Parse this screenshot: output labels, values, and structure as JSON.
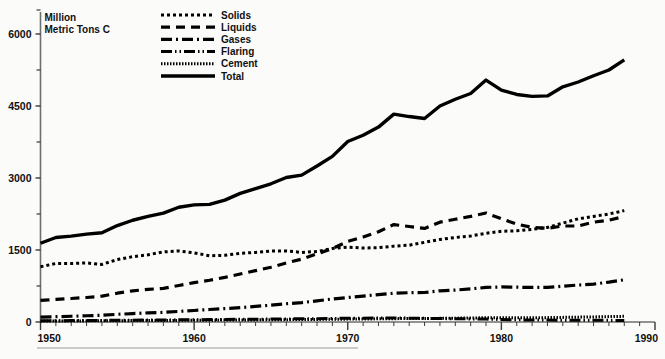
{
  "chart_data": {
    "type": "line",
    "title": "",
    "unit_label_line1": "Million",
    "unit_label_line2": "Metric Tons C",
    "xlabel": "",
    "ylabel": "Million Metric Tons C",
    "xlim": [
      1950,
      1990
    ],
    "ylim": [
      0,
      6500
    ],
    "grid": false,
    "legend_position": "top-center",
    "x_ticks": [
      1950,
      1960,
      1970,
      1980,
      1990
    ],
    "x_tick_labels": [
      "1950",
      "1960",
      "1970",
      "1980",
      "1990"
    ],
    "x_minor_tick_step": 1,
    "y_ticks": [
      0,
      1500,
      3000,
      4500,
      6000
    ],
    "y_tick_labels": [
      "0",
      "1500",
      "3000",
      "4500",
      "6000"
    ],
    "y_minor_ticks": [
      750,
      2250,
      3750,
      5250,
      6500
    ],
    "x": [
      1950,
      1951,
      1952,
      1953,
      1954,
      1955,
      1956,
      1957,
      1958,
      1959,
      1960,
      1961,
      1962,
      1963,
      1964,
      1965,
      1966,
      1967,
      1968,
      1969,
      1970,
      1971,
      1972,
      1973,
      1974,
      1975,
      1976,
      1977,
      1978,
      1979,
      1980,
      1981,
      1982,
      1983,
      1984,
      1985,
      1986,
      1987,
      1988
    ],
    "series": [
      {
        "name": "Solids",
        "dash": "3,3",
        "width": 3.0,
        "color": "#000000",
        "values": [
          1150,
          1220,
          1220,
          1230,
          1200,
          1300,
          1360,
          1400,
          1460,
          1480,
          1440,
          1380,
          1390,
          1430,
          1450,
          1480,
          1480,
          1450,
          1470,
          1530,
          1560,
          1540,
          1550,
          1580,
          1600,
          1660,
          1720,
          1760,
          1790,
          1850,
          1890,
          1900,
          1930,
          1970,
          2060,
          2150,
          2200,
          2250,
          2320
        ]
      },
      {
        "name": "Liquids",
        "dash": "9,6",
        "width": 3.2,
        "color": "#000000",
        "values": [
          450,
          470,
          490,
          510,
          540,
          600,
          650,
          680,
          700,
          760,
          820,
          870,
          930,
          1000,
          1070,
          1140,
          1230,
          1310,
          1420,
          1530,
          1680,
          1770,
          1880,
          2030,
          1990,
          1950,
          2080,
          2140,
          2200,
          2270,
          2150,
          2040,
          1970,
          1950,
          2000,
          2000,
          2080,
          2120,
          2200
        ]
      },
      {
        "name": "Gases",
        "dash": "11,4,2,4",
        "width": 3.2,
        "color": "#000000",
        "values": [
          100,
          110,
          120,
          130,
          140,
          160,
          175,
          190,
          200,
          220,
          240,
          260,
          280,
          300,
          325,
          350,
          380,
          405,
          440,
          480,
          510,
          540,
          570,
          600,
          610,
          615,
          650,
          665,
          690,
          720,
          730,
          725,
          720,
          720,
          745,
          770,
          790,
          830,
          880
        ]
      },
      {
        "name": "Flaring",
        "dash": "11,3,1.5,3,1.5,3",
        "width": 3.0,
        "color": "#000000",
        "values": [
          25,
          27,
          29,
          31,
          33,
          36,
          38,
          40,
          42,
          45,
          48,
          50,
          53,
          56,
          58,
          61,
          64,
          67,
          70,
          74,
          78,
          80,
          82,
          84,
          80,
          76,
          72,
          68,
          64,
          60,
          52,
          46,
          42,
          40,
          38,
          36,
          35,
          34,
          33
        ]
      },
      {
        "name": "Cement",
        "dash": "1.5,1.5",
        "width": 3.0,
        "color": "#000000",
        "values": [
          18,
          20,
          21,
          23,
          25,
          27,
          29,
          31,
          32,
          34,
          36,
          38,
          40,
          42,
          44,
          46,
          49,
          51,
          54,
          57,
          60,
          63,
          66,
          70,
          71,
          72,
          76,
          80,
          84,
          88,
          90,
          89,
          88,
          91,
          96,
          101,
          106,
          112,
          118
        ]
      },
      {
        "name": "Total",
        "dash": "none",
        "width": 3.4,
        "color": "#000000",
        "values": [
          1640,
          1760,
          1790,
          1830,
          1860,
          2010,
          2120,
          2200,
          2270,
          2390,
          2440,
          2450,
          2540,
          2680,
          2780,
          2880,
          3010,
          3060,
          3250,
          3450,
          3760,
          3890,
          4060,
          4330,
          4280,
          4240,
          4500,
          4640,
          4760,
          5040,
          4830,
          4740,
          4700,
          4710,
          4900,
          5000,
          5130,
          5250,
          5460
        ]
      }
    ],
    "legend": [
      {
        "label": "Solids"
      },
      {
        "label": "Liquids"
      },
      {
        "label": "Gases"
      },
      {
        "label": "Flaring"
      },
      {
        "label": "Cement"
      },
      {
        "label": "Total"
      }
    ]
  }
}
